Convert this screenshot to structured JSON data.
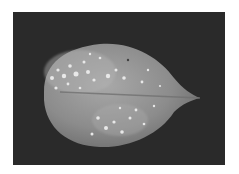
{
  "image": {
    "subject": "leaf",
    "description": "Grayscale photograph of a single oval leaf with a pointed tip to the right, showing pale speckled spots, on a dark background",
    "colors": {
      "background": "#2a2a2a",
      "border": "#ffffff",
      "leaf_base": "#8f8f8f",
      "leaf_light": "#c8c8c8",
      "spots": "#e6e6e6"
    }
  }
}
